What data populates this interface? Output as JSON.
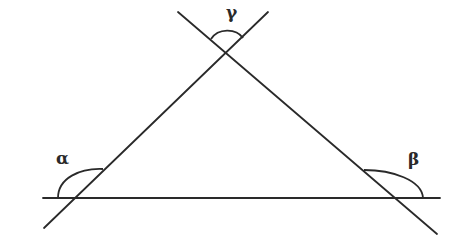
{
  "diagram": {
    "type": "geometry-triangle",
    "colors": {
      "stroke": "#2a2a2a",
      "background": "#ffffff"
    },
    "lines": [
      {
        "id": "base",
        "x1": 43,
        "y1": 198,
        "x2": 440,
        "y2": 198
      },
      {
        "id": "left-side",
        "x1": 44,
        "y1": 228,
        "x2": 268,
        "y2": 12
      },
      {
        "id": "right-side",
        "x1": 178,
        "y1": 12,
        "x2": 437,
        "y2": 234
      }
    ],
    "angles": [
      {
        "id": "alpha",
        "label": "α",
        "label_x": 56,
        "label_y": 150,
        "position": "exterior angle at bottom-left vertex"
      },
      {
        "id": "beta",
        "label": "β",
        "label_x": 408,
        "label_y": 151,
        "position": "exterior angle at bottom-right vertex"
      },
      {
        "id": "gamma",
        "label": "γ",
        "label_x": 226,
        "label_y": 4,
        "position": "vertical angle above top vertex"
      }
    ]
  }
}
